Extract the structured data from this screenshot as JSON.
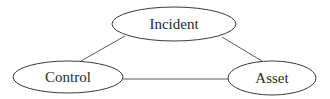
{
  "diagram": {
    "type": "undirected-graph",
    "nodes": [
      {
        "id": "incident",
        "label": "Incident",
        "cx": 174,
        "cy": 24,
        "rx": 62,
        "ry": 17
      },
      {
        "id": "control",
        "label": "Control",
        "cx": 68,
        "cy": 77,
        "rx": 55,
        "ry": 16
      },
      {
        "id": "asset",
        "label": "Asset",
        "cx": 272,
        "cy": 78,
        "rx": 44,
        "ry": 17
      }
    ],
    "edges": [
      {
        "from": "incident",
        "to": "control"
      },
      {
        "from": "incident",
        "to": "asset"
      },
      {
        "from": "control",
        "to": "asset"
      }
    ]
  }
}
